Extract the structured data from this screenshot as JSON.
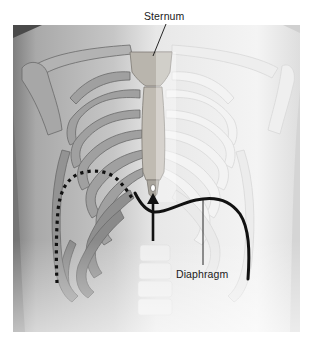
{
  "figure": {
    "labels": {
      "sternum": "Sternum",
      "diaphragm": "Diaphragm"
    },
    "annotations": {
      "dotted_curve": "diaphragm outline at rib margin (left side)",
      "solid_curve": "diaphragm dome outline",
      "arrow": "upward arrow beneath xiphoid process"
    },
    "colors": {
      "background": "#ffffff",
      "frame_bg": "#e9e9e9",
      "skin_dark": "#8a8a8a",
      "skin_mid": "#b8b8b8",
      "bone_left": "#9c9c9c",
      "bone_right": "#f2f2f2",
      "line": "#111111"
    }
  }
}
